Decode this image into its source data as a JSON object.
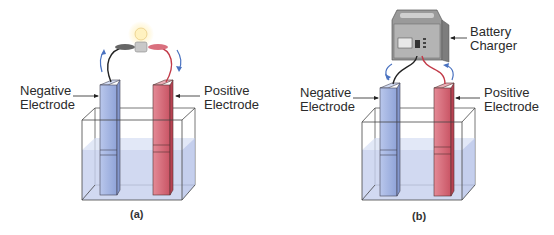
{
  "panels": [
    {
      "id": "a",
      "caption": "(a)",
      "left_label": {
        "line1": "Negative",
        "line2": "Electrode"
      },
      "right_label": {
        "line1": "Positive",
        "line2": "Electrode"
      },
      "device": "light-bulb",
      "current_direction": "discharging"
    },
    {
      "id": "b",
      "caption": "(b)",
      "left_label": {
        "line1": "Negative",
        "line2": "Electrode"
      },
      "right_label": {
        "line1": "Positive",
        "line2": "Electrode"
      },
      "device_label": {
        "line1": "Battery",
        "line2": "Charger"
      },
      "device": "battery-charger",
      "current_direction": "charging"
    }
  ],
  "colors": {
    "negative_electrode": "#a9b9e3",
    "positive_electrode": "#d9707e",
    "electrolyte": "#c5d0ee",
    "arrow_blue": "#4a72c0",
    "wire_red": "#c23a48",
    "wire_black": "#222222"
  }
}
